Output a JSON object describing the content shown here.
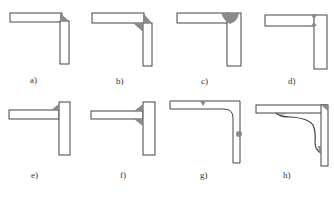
{
  "figure": {
    "panels": [
      {
        "id": "a",
        "label": "a)",
        "joint": "corner joint, outside fillet weld"
      },
      {
        "id": "b",
        "label": "b)",
        "joint": "corner joint, outside and inside fillet welds"
      },
      {
        "id": "c",
        "label": "c)",
        "joint": "corner joint, full-penetration groove weld"
      },
      {
        "id": "d",
        "label": "d)",
        "joint": "corner joint, double-sided weld"
      },
      {
        "id": "e",
        "label": "e)",
        "joint": "T-joint, single fillet weld"
      },
      {
        "id": "f",
        "label": "f)",
        "joint": "T-joint, double fillet welds"
      },
      {
        "id": "g",
        "label": "g)",
        "joint": "bent plate with welds away from corner"
      },
      {
        "id": "h",
        "label": "h)",
        "joint": "corner joint with curved stiffening member"
      }
    ],
    "colors": {
      "outline": "#444444",
      "weld_fill": "#8a8a8a",
      "background": "#ffffff"
    }
  }
}
